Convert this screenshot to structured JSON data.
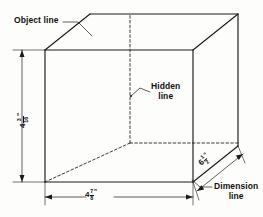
{
  "figure": {
    "type": "isometric-box-technical-drawing"
  },
  "annotations": {
    "object_line": "Object line",
    "hidden_line_1": "Hidden",
    "hidden_line_2": "line",
    "dimension_line_1": "Dimension",
    "dimension_line_2": "line"
  },
  "dimensions": {
    "width": {
      "whole": "4",
      "numerator": "7",
      "denominator": "8",
      "unit": "\""
    },
    "height": {
      "whole": "4",
      "numerator": "3",
      "denominator": "16",
      "unit": "\""
    },
    "depth": {
      "whole": "6",
      "numerator": "1",
      "denominator": "2",
      "unit": "\""
    }
  },
  "style": {
    "line_color": "#1a1a1a",
    "background": "#fdfdfc"
  }
}
